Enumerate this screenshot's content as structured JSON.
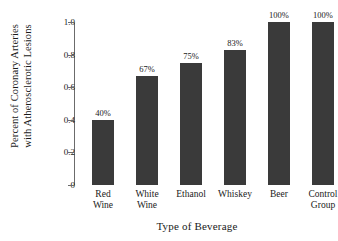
{
  "chart_data": {
    "type": "bar",
    "title": "",
    "xlabel": "Type of Beverage",
    "ylabel_lines": [
      "Percent of Coronary Arteries",
      "with Atherosclerotic Lesions"
    ],
    "categories": [
      "Red Wine",
      "White Wine",
      "Ethanol",
      "Whiskey",
      "Beer",
      "Control Group"
    ],
    "category_lines": [
      [
        "Red",
        "Wine"
      ],
      [
        "White",
        "Wine"
      ],
      [
        "Ethanol"
      ],
      [
        "Whiskey"
      ],
      [
        "Beer"
      ],
      [
        "Control",
        "Group"
      ]
    ],
    "values": [
      0.4,
      0.67,
      0.75,
      0.83,
      1.0,
      1.0
    ],
    "data_labels": [
      "40%",
      "67%",
      "75%",
      "83%",
      "100%",
      "100%"
    ],
    "ylim": [
      0,
      1.0
    ],
    "yticks": [
      0,
      0.2,
      0.4,
      0.6,
      0.8,
      1.0
    ],
    "ytick_labels": [
      "0",
      "0.2",
      "0.4",
      "0.6",
      "0.8",
      "1.0"
    ],
    "grid": false,
    "legend": false,
    "bar_color": "#3a3a3a",
    "axis_color": "#6b6b6b",
    "background": "#ffffff"
  }
}
